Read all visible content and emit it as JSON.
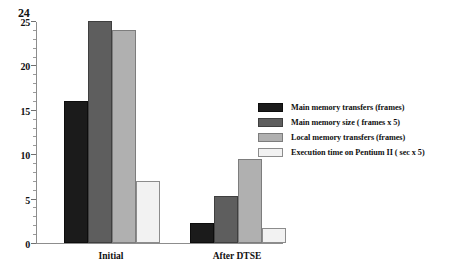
{
  "chart_data": {
    "type": "bar",
    "title": "",
    "xlabel": "",
    "ylabel": "",
    "categories": [
      "Initial",
      "After DTSE"
    ],
    "series": [
      {
        "name": "Main memory transfers (frames)",
        "color": "#1b1b1b",
        "values": [
          16,
          2.2
        ]
      },
      {
        "name": "Main memory size ( frames x 5)",
        "color": "#5e5e5e",
        "values": [
          25,
          5.3
        ]
      },
      {
        "name": "Local memory transfers (frames)",
        "color": "#b0b0b0",
        "values": [
          24,
          9.5
        ]
      },
      {
        "name": "Execution time on Pentium II ( sec x 5)",
        "color": "#f2f2f2",
        "values": [
          7,
          1.7
        ]
      }
    ],
    "ylim": [
      0,
      25
    ],
    "yticks": [
      0,
      5,
      10,
      15,
      20,
      25
    ],
    "ytick_labels": [
      "0",
      "5",
      "10",
      "15",
      "20",
      "25"
    ],
    "yminor_step": 1,
    "grid": false,
    "legend_position": "right",
    "annotations": [
      {
        "text": "24",
        "near_tick": 25,
        "note": "handwritten correction above the 25 tick label"
      }
    ]
  },
  "axis": {
    "annotation_24": "24"
  }
}
